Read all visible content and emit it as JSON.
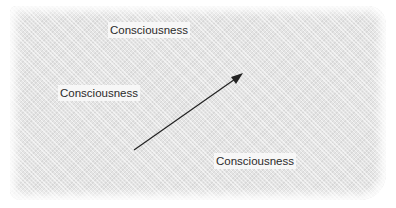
{
  "diagram": {
    "labels": [
      {
        "text": "Consciousness",
        "position": "top-center"
      },
      {
        "text": "Consciousness",
        "position": "middle-left"
      },
      {
        "text": "Consciousness",
        "position": "bottom-right"
      }
    ],
    "arrow": {
      "from": [
        134,
        150
      ],
      "to": [
        243,
        73
      ],
      "color": "#222222"
    },
    "background_color": "#e4e4e4"
  }
}
